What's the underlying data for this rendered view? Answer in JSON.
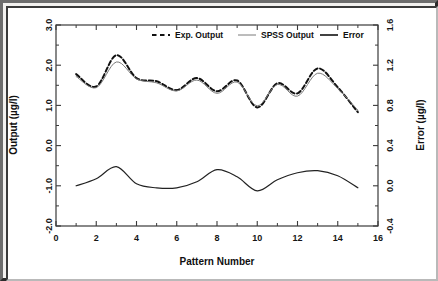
{
  "figure": {
    "frame_border_color": "#2b2b2b",
    "plot_background": "#ffffff"
  },
  "chart_data": {
    "type": "line",
    "title": "",
    "subtitle": "",
    "xlabel": "Pattern Number",
    "ylabel": "Output (µg/l)",
    "y2label": "Error (µg/l)",
    "xlim": [
      0,
      16
    ],
    "ylim": [
      -2.0,
      3.0
    ],
    "y2lim": [
      -0.4,
      1.6
    ],
    "xticks": [
      0,
      2,
      4,
      6,
      8,
      10,
      12,
      14,
      16
    ],
    "xticklabels": [
      "0",
      "2",
      "4",
      "6",
      "8",
      "10",
      "12",
      "14",
      "16"
    ],
    "yticks": [
      -2.0,
      -1.0,
      0.0,
      1.0,
      2.0,
      3.0
    ],
    "yticklabels": [
      "-2.0",
      "-1.0",
      "0.0",
      "1.0",
      "2.0",
      "3.0"
    ],
    "y2ticks": [
      -0.4,
      0.0,
      0.4,
      0.8,
      1.2,
      1.6
    ],
    "y2ticklabels": [
      "-0.4",
      "0.0",
      "0.4",
      "0.8",
      "1.2",
      "1.6"
    ],
    "minor_ticks": true,
    "grid": false,
    "legend_position": "top-center",
    "x": [
      1,
      2,
      3,
      4,
      5,
      6,
      7,
      8,
      9,
      10,
      11,
      12,
      13,
      14,
      15
    ],
    "series": [
      {
        "name": "Exp. Output",
        "axis": "left",
        "style": "dashed",
        "color": "#111111",
        "linewidth": 2.0,
        "values": [
          1.78,
          1.47,
          2.25,
          1.68,
          1.6,
          1.38,
          1.68,
          1.35,
          1.62,
          0.95,
          1.55,
          1.3,
          1.92,
          1.45,
          0.83
        ]
      },
      {
        "name": "SPSS Output",
        "axis": "left",
        "style": "solid-thin",
        "color": "#7a7a7a",
        "linewidth": 1.0,
        "values": [
          1.72,
          1.44,
          2.08,
          1.66,
          1.56,
          1.36,
          1.63,
          1.3,
          1.58,
          0.99,
          1.52,
          1.23,
          1.8,
          1.42,
          0.88
        ]
      },
      {
        "name": "Error",
        "axis": "right",
        "style": "solid",
        "color": "#222222",
        "linewidth": 1.2,
        "values": [
          0.0,
          0.07,
          0.19,
          0.02,
          -0.02,
          -0.02,
          0.04,
          0.16,
          0.09,
          -0.05,
          0.06,
          0.13,
          0.15,
          0.1,
          -0.02
        ]
      }
    ],
    "legend": [
      {
        "label": "Exp. Output",
        "marker": "dashed-line",
        "color": "#111111"
      },
      {
        "label": "SPSS Output",
        "marker": "thin-line",
        "color": "#7a7a7a"
      },
      {
        "label": "Error",
        "marker": "solid-line",
        "color": "#111111"
      }
    ]
  }
}
